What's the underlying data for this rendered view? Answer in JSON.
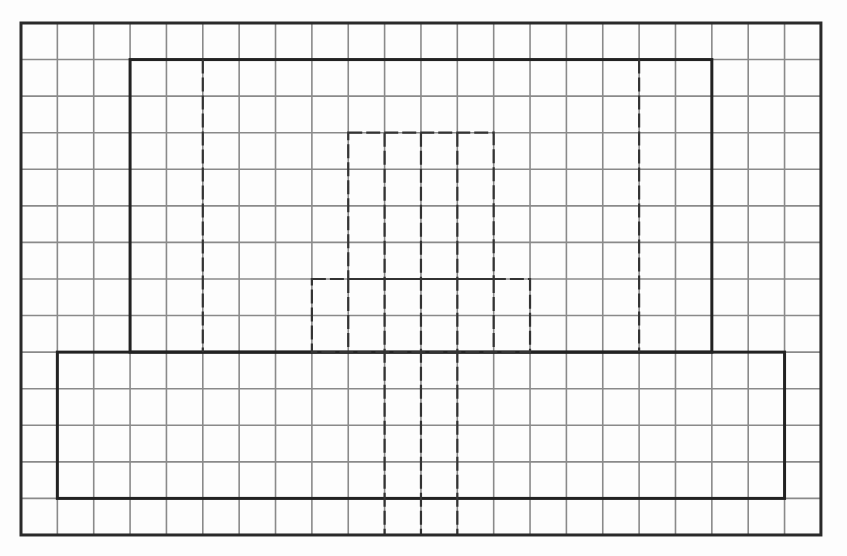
{
  "diagram": {
    "title": "",
    "type": "grid-outline-drawing",
    "background_color": "#fdfdfd",
    "grid": {
      "columns": 22,
      "rows": 14,
      "origin_x": 21,
      "origin_y": 23,
      "cell_width": 36.36,
      "cell_height": 36.57,
      "line_color": "#8a8a8a",
      "line_width": 1.6
    },
    "outer_border": {
      "color": "#2a2a2a",
      "width": 3
    },
    "thick_color": "#222222",
    "dashed_color": "#333333",
    "shapes": [
      {
        "name": "upper-block",
        "kind": "rect",
        "style": "thick",
        "c0": 3,
        "r0": 1,
        "c1": 19,
        "r1": 9
      },
      {
        "name": "base-block",
        "kind": "rect",
        "style": "thick",
        "c0": 1,
        "r0": 9,
        "c1": 21,
        "r1": 13
      },
      {
        "name": "left-dashed-divider",
        "kind": "line",
        "style": "dashed",
        "c0": 5,
        "r0": 1,
        "c1": 5,
        "r1": 9
      },
      {
        "name": "right-dashed-divider",
        "kind": "line",
        "style": "dashed",
        "c0": 17,
        "r0": 1,
        "c1": 17,
        "r1": 9
      },
      {
        "name": "center-upper-dashed-rect",
        "kind": "rect",
        "style": "dashed",
        "c0": 9,
        "r0": 3,
        "c1": 13,
        "r1": 7
      },
      {
        "name": "center-lower-dashed-rect",
        "kind": "rect",
        "style": "dashed",
        "c0": 8,
        "r0": 7,
        "c1": 14,
        "r1": 9
      },
      {
        "name": "center-dashed-line-1",
        "kind": "line",
        "style": "dashed",
        "c0": 10,
        "r0": 3,
        "c1": 10,
        "r1": 14
      },
      {
        "name": "center-dashed-line-2",
        "kind": "line",
        "style": "dashed",
        "c0": 11,
        "r0": 3,
        "c1": 11,
        "r1": 14
      },
      {
        "name": "center-dashed-line-3",
        "kind": "line",
        "style": "dashed",
        "c0": 12,
        "r0": 3,
        "c1": 12,
        "r1": 14
      },
      {
        "name": "center-dashed-extension-left",
        "kind": "line",
        "style": "dashed",
        "c0": 9,
        "r0": 7,
        "c1": 9,
        "r1": 9
      },
      {
        "name": "center-dashed-extension-right",
        "kind": "line",
        "style": "dashed",
        "c0": 13,
        "r0": 7,
        "c1": 13,
        "r1": 9
      }
    ]
  }
}
